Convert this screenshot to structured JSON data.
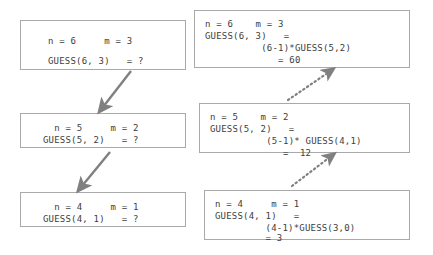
{
  "diagram": {
    "background_color": "#ffffff",
    "box_border_color": "#a9a9a9",
    "text_color": "#3d3d3d",
    "arrow_color": "#808080"
  },
  "left_column": {
    "label": "Descending recursive calls (unresolved)",
    "boxes": [
      {
        "name": "guess-6-3-call",
        "line1": "n = 6     m = 3",
        "line2": "GUESS(6, 3)   = ?"
      },
      {
        "name": "guess-5-2-call",
        "line1": "  n = 5     m = 2",
        "line2": "GUESS(5, 2)   = ?"
      },
      {
        "name": "guess-4-1-call",
        "line1": "  n = 4     m = 1",
        "line2": "GUESS(4, 1)   = ?"
      }
    ]
  },
  "right_column": {
    "label": "Returning values (resolved)",
    "boxes": [
      {
        "name": "guess-6-3-result",
        "line1": "n = 6    m = 3",
        "line2": "GUESS(6, 3)   =",
        "line3": "          (6-1)*GUESS(5,2)",
        "line4": "             = 60"
      },
      {
        "name": "guess-5-2-result",
        "line1": "n = 5    m = 2",
        "line2": "GUESS(5, 2)   =",
        "line3": "          (5-1)* GUESS(4,1)",
        "line4": "             =  12"
      },
      {
        "name": "guess-4-1-result",
        "line1": "n = 4     m = 1",
        "line2": "GUESS(4, 1)   =",
        "line3": "         (4-1)*GUESS(3,0)",
        "line4": "         = 3"
      }
    ]
  },
  "arrows": {
    "descent": [
      {
        "name": "arrow-call-6to5",
        "style": "solid"
      },
      {
        "name": "arrow-call-5to4",
        "style": "solid"
      }
    ],
    "return": [
      {
        "name": "arrow-return-5to6",
        "style": "dotted"
      },
      {
        "name": "arrow-return-4to5",
        "style": "dotted"
      }
    ]
  }
}
